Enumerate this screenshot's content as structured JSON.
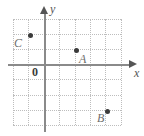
{
  "figure": {
    "type": "coordinate-plane",
    "width": 144,
    "height": 136,
    "background_color": "#ffffff"
  },
  "axes": {
    "x_axis": {
      "label": "x",
      "label_x": 134,
      "label_y": 67,
      "line_y": 64,
      "line_x_start": 8,
      "line_x_end": 130,
      "arrow_x": 129,
      "arrow_y": 60,
      "color": "#8a8a8a"
    },
    "y_axis": {
      "label": "y",
      "label_x": 50,
      "label_y": 3,
      "line_x": 44,
      "line_y_start": 14,
      "line_y_end": 132,
      "arrow_x": 40,
      "arrow_y": 6,
      "color": "#8a8a8a"
    },
    "origin": {
      "label": "0",
      "label_x": 32,
      "label_y": 66
    }
  },
  "grid": {
    "color": "#bdbdbd",
    "style": "dotted",
    "spacing": 15.4,
    "x_start": 13,
    "x_end": 122,
    "y_start": 19,
    "y_end": 125,
    "vertical_lines": [
      13,
      28.4,
      43.8,
      59.2,
      74.6,
      90,
      105.4,
      120.8
    ],
    "horizontal_lines": [
      19,
      34.1,
      49.2,
      64.3,
      79.4,
      94.5,
      109.6,
      124.7
    ]
  },
  "points": [
    {
      "name": "C",
      "label": "C",
      "dot_x": 28,
      "dot_y": 33,
      "label_x": 14,
      "label_y": 37,
      "grid_coords": [
        -1,
        2
      ]
    },
    {
      "name": "A",
      "label": "A",
      "dot_x": 74,
      "dot_y": 48,
      "label_x": 79,
      "label_y": 53,
      "grid_coords": [
        2,
        1
      ]
    },
    {
      "name": "B",
      "label": "B",
      "dot_x": 105,
      "dot_y": 109,
      "label_x": 97,
      "label_y": 112,
      "grid_coords": [
        4,
        -3
      ]
    }
  ]
}
